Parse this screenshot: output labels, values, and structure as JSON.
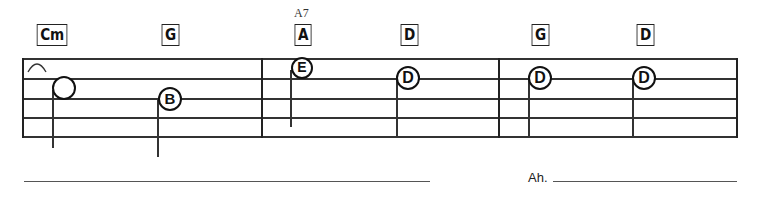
{
  "chords": [
    {
      "label": "Cm",
      "x": 34,
      "y": 24
    },
    {
      "label": "G",
      "x": 160,
      "y": 24
    },
    {
      "label": "A",
      "x": 293,
      "y": 24,
      "alt_label": "A7"
    },
    {
      "label": "D",
      "x": 399,
      "y": 24
    },
    {
      "label": "G",
      "x": 530,
      "y": 24
    },
    {
      "label": "D",
      "x": 635,
      "y": 24
    }
  ],
  "notes": [
    {
      "letter": "",
      "x": 64,
      "y": 88,
      "size": 24,
      "stem_top": 88,
      "stem_bottom": 148,
      "stem_x": 53
    },
    {
      "letter": "B",
      "x": 170,
      "y": 98,
      "size": 24,
      "stem_top": 98,
      "stem_bottom": 157,
      "stem_x": 158
    },
    {
      "letter": "E",
      "x": 302,
      "y": 68,
      "size": 22,
      "stem_top": 68,
      "stem_bottom": 127,
      "stem_x": 291
    },
    {
      "letter": "D",
      "x": 408,
      "y": 78,
      "size": 24,
      "stem_top": 78,
      "stem_bottom": 137,
      "stem_x": 396
    },
    {
      "letter": "D",
      "x": 540,
      "y": 78,
      "size": 24,
      "stem_top": 78,
      "stem_bottom": 137,
      "stem_x": 529
    },
    {
      "letter": "D",
      "x": 644,
      "y": 78,
      "size": 24,
      "stem_top": 78,
      "stem_bottom": 137,
      "stem_x": 632
    }
  ],
  "lyrics": {
    "measure_2_text": "Ah."
  },
  "colors": {
    "ink": "#111111",
    "paper": "#ffffff"
  }
}
